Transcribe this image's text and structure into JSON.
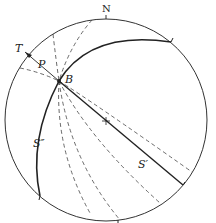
{
  "diagram": {
    "type": "stereonet",
    "labels": {
      "north": "N",
      "T": "T",
      "P": "P",
      "B": "B",
      "S_double_prime": "S″",
      "S_prime": "S′"
    },
    "colors": {
      "stroke": "#333333",
      "background": "#ffffff"
    }
  }
}
